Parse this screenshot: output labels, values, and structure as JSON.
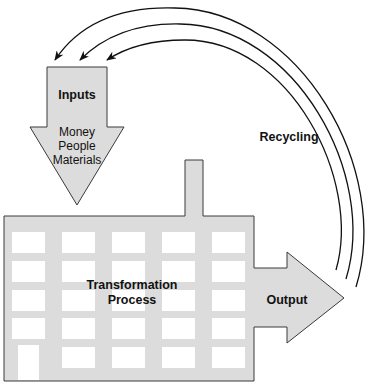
{
  "diagram": {
    "type": "process-flow",
    "colors": {
      "fill": "#dcdcdc",
      "stroke": "#3a3a3a",
      "window": "#ffffff",
      "arrow_line": "#111111"
    },
    "inputs": {
      "title": "Inputs",
      "items": [
        "Money",
        "People",
        "Materials"
      ]
    },
    "process": {
      "line1": "Transformation",
      "line2": "Process"
    },
    "output": {
      "label": "Output"
    },
    "feedback": {
      "label": "Recycling",
      "arc_count": 3
    }
  }
}
